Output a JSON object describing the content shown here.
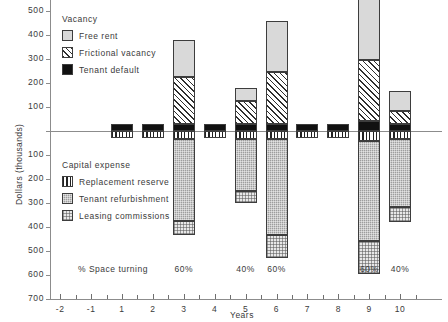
{
  "chart_data": {
    "type": "bar",
    "title": "",
    "subtitle": "",
    "xlabel": "Years",
    "ylabel": "Dollars (thousands)",
    "grid": false,
    "stacked": true,
    "orientation": "vertical",
    "ylim": [
      -700,
      600
    ],
    "y_ticks": [
      600,
      500,
      400,
      300,
      200,
      100,
      0,
      -100,
      -200,
      -300,
      -400,
      -500,
      -600,
      -700
    ],
    "y_tick_labels": [
      "600",
      "500",
      "400",
      "300",
      "200",
      "100",
      "",
      "100",
      "200",
      "300",
      "400",
      "500",
      "600",
      "700"
    ],
    "x_ticks": [
      -2,
      -1,
      1,
      2,
      3,
      4,
      5,
      6,
      7,
      8,
      9,
      10
    ],
    "x_tick_labels": [
      "-2",
      "-1",
      "1",
      "2",
      "3",
      "4",
      "5",
      "6",
      "7",
      "8",
      "9",
      "10"
    ],
    "categories": [
      1,
      2,
      3,
      4,
      5,
      6,
      7,
      8,
      9,
      10
    ],
    "series": [
      {
        "name": "Free rent",
        "key": "free_rent",
        "sign": "positive",
        "pattern": "solid-light-gray",
        "color": "#d9d9d9",
        "values": [
          0,
          0,
          155,
          0,
          55,
          215,
          0,
          0,
          275,
          80
        ]
      },
      {
        "name": "Frictional vacancy",
        "key": "frictional_vacancy",
        "sign": "positive",
        "pattern": "diagonal-hatch",
        "color": "#ffffff",
        "values": [
          0,
          0,
          195,
          0,
          95,
          215,
          0,
          0,
          255,
          55
        ]
      },
      {
        "name": "Tenant default",
        "key": "tenant_default",
        "sign": "positive",
        "pattern": "solid-black",
        "color": "#111111",
        "values": [
          30,
          30,
          30,
          30,
          30,
          30,
          30,
          30,
          40,
          30
        ]
      },
      {
        "name": "Replacement reserve",
        "key": "replacement_reserve",
        "sign": "negative",
        "pattern": "vertical-stripes",
        "color": "#ffffff",
        "values": [
          30,
          30,
          35,
          30,
          35,
          35,
          30,
          30,
          40,
          35
        ]
      },
      {
        "name": "Tenant refurbishment",
        "key": "tenant_refurbishment",
        "sign": "negative",
        "pattern": "dark-gray-check",
        "color": "#9e9e9e",
        "values": [
          0,
          0,
          340,
          0,
          215,
          400,
          0,
          0,
          420,
          280
        ]
      },
      {
        "name": "Leasing commissions",
        "key": "leasing_commissions",
        "sign": "negative",
        "pattern": "light-dot-grid",
        "color": "#e8e8e8",
        "values": [
          0,
          0,
          60,
          0,
          50,
          95,
          0,
          0,
          135,
          65
        ]
      }
    ],
    "annotations": {
      "row_label": "% Space turning",
      "space_turning": [
        {
          "year": 3,
          "label": "60%"
        },
        {
          "year": 5,
          "label": "40%"
        },
        {
          "year": 6,
          "label": "60%"
        },
        {
          "year": 9,
          "label": "60%"
        },
        {
          "year": 10,
          "label": "40%"
        }
      ]
    },
    "legends": [
      {
        "title": "Vacancy",
        "position": "upper-left-inside",
        "entries": [
          {
            "label": "Free rent",
            "pattern": "solid-light-gray"
          },
          {
            "label": "Frictional vacancy",
            "pattern": "diagonal-hatch"
          },
          {
            "label": "Tenant default",
            "pattern": "solid-black"
          }
        ]
      },
      {
        "title": "Capital expense",
        "position": "lower-left-inside",
        "entries": [
          {
            "label": "Replacement reserve",
            "pattern": "vertical-stripes"
          },
          {
            "label": "Tenant refurbishment",
            "pattern": "dark-gray-check"
          },
          {
            "label": "Leasing commissions",
            "pattern": "light-dot-grid"
          }
        ]
      }
    ]
  }
}
